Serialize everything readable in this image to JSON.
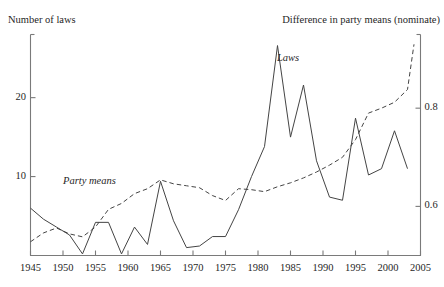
{
  "top_cut_text": "~ ~  ~~ ~~ ~  ~",
  "axes": {
    "left_title": "Number of laws",
    "right_title": "Difference in party means (nominate)",
    "left_ticks": [
      {
        "value": 10,
        "label": "10"
      },
      {
        "value": 20,
        "label": "20"
      }
    ],
    "right_ticks": [
      {
        "value": 0.6,
        "label": "0.6"
      },
      {
        "value": 0.8,
        "label": "0.8"
      }
    ],
    "x_ticks": [
      "1945",
      "1950",
      "1955",
      "1960",
      "1965",
      "1970",
      "1975",
      "1980",
      "1985",
      "1990",
      "1995",
      "2000",
      "2005"
    ]
  },
  "series_labels": {
    "laws": "Laws",
    "party_means": "Party means"
  },
  "colors": {
    "line": "#444444",
    "frame": "#7a7a7a",
    "text": "#1f1f1f"
  },
  "chart_data": {
    "type": "line",
    "title": "",
    "subtitle": "",
    "xlabel": "",
    "ylabel": "Number of laws",
    "y2label": "Difference in party means (nominate)",
    "xlim": [
      1945,
      2005
    ],
    "ylim": [
      0,
      28
    ],
    "y2lim": [
      0.5,
      0.95
    ],
    "grid": false,
    "legend": "inline-annotations",
    "series": [
      {
        "name": "Laws",
        "axis": "left",
        "style": "solid",
        "x": [
          1945,
          1947,
          1949,
          1951,
          1953,
          1955,
          1957,
          1959,
          1961,
          1963,
          1965,
          1967,
          1969,
          1971,
          1973,
          1975,
          1977,
          1979,
          1981,
          1983,
          1985,
          1987,
          1989,
          1991,
          1993,
          1995,
          1997,
          1999,
          2001,
          2003
        ],
        "values": [
          6.0,
          4.6,
          3.6,
          2.6,
          0.2,
          4.2,
          4.2,
          0.2,
          3.6,
          1.4,
          9.4,
          4.4,
          1.0,
          1.2,
          2.4,
          2.4,
          5.8,
          10.0,
          13.8,
          26.6,
          15.0,
          21.6,
          12.0,
          7.4,
          7.0,
          17.4,
          10.2,
          11.0,
          15.8,
          11.0
        ]
      },
      {
        "name": "Party means",
        "axis": "right",
        "style": "dashed",
        "x": [
          1945,
          1947,
          1949,
          1951,
          1953,
          1955,
          1957,
          1959,
          1961,
          1963,
          1965,
          1967,
          1969,
          1971,
          1973,
          1975,
          1977,
          1979,
          1981,
          1983,
          1985,
          1987,
          1989,
          1991,
          1993,
          1995,
          1997,
          1999,
          2001,
          2003,
          2004
        ],
        "values": [
          0.528,
          0.546,
          0.556,
          0.544,
          0.538,
          0.558,
          0.594,
          0.606,
          0.626,
          0.636,
          0.654,
          0.646,
          0.642,
          0.638,
          0.622,
          0.612,
          0.636,
          0.634,
          0.63,
          0.64,
          0.648,
          0.658,
          0.67,
          0.684,
          0.7,
          0.736,
          0.79,
          0.8,
          0.812,
          0.838,
          0.93
        ]
      }
    ]
  }
}
